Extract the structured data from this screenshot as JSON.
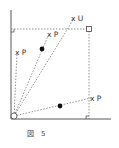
{
  "figure": {
    "caption_symbol": "図",
    "caption_number": "5",
    "colors": {
      "line": "#444444",
      "dash": "#666666",
      "dot": "#111111",
      "background": "#ffffff"
    }
  },
  "labels": {
    "u": "x U",
    "p_upper": "x P",
    "p_left": "x P",
    "p_right": "x P"
  },
  "points": [
    {
      "name": "U",
      "x": 74,
      "y": 18
    },
    {
      "name": "P-upper",
      "x": 49,
      "y": 34
    },
    {
      "name": "P-left",
      "x": 17,
      "y": 52
    },
    {
      "name": "P-right",
      "x": 92,
      "y": 98
    }
  ]
}
